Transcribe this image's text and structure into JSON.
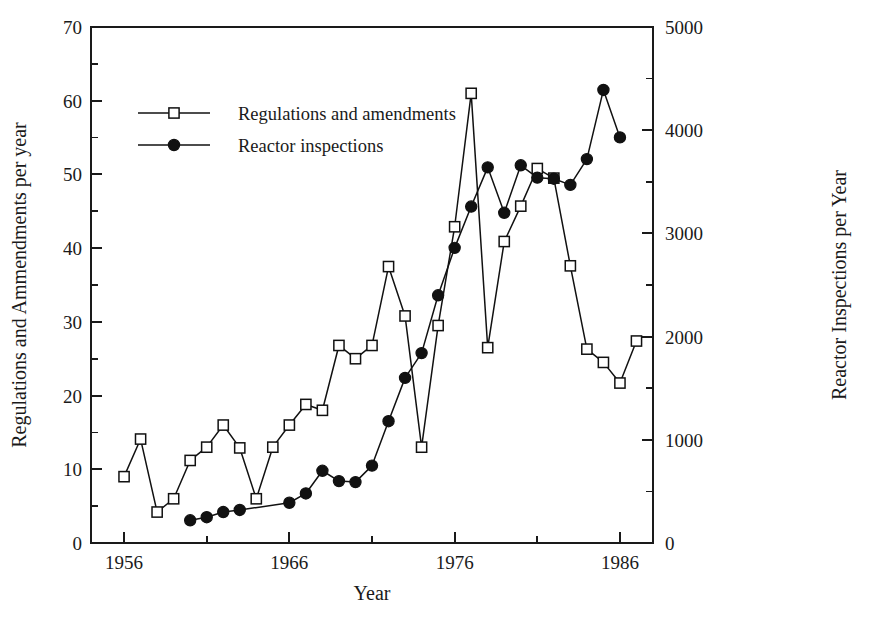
{
  "chart_data": {
    "type": "line",
    "title": "",
    "xlabel": "Year",
    "ylabel": "Regulations and Ammendments per year",
    "y2label": "Reactor Inspections per Year",
    "xlim": [
      1954,
      1988
    ],
    "ylim": [
      0,
      70
    ],
    "y2lim": [
      0,
      5000
    ],
    "grid": false,
    "legend_position": "upper-left-inside",
    "x_ticks_major": [
      "1956",
      "1966",
      "1976",
      "1986"
    ],
    "x_tick_major_values": [
      1956,
      1966,
      1976,
      1986
    ],
    "x_tick_minor_values": [
      1961,
      1971,
      1981,
      1986
    ],
    "y_ticks_major": [
      "0",
      "10",
      "20",
      "30",
      "40",
      "50",
      "60",
      "70"
    ],
    "y_tick_major_values": [
      0,
      10,
      20,
      30,
      40,
      50,
      60,
      70
    ],
    "y_tick_minor_values": [
      5,
      15,
      25,
      35,
      45,
      55,
      65
    ],
    "y2_ticks_major": [
      "0",
      "1000",
      "2000",
      "3000",
      "4000",
      "5000"
    ],
    "y2_tick_major_values": [
      0,
      1000,
      2000,
      3000,
      4000,
      5000
    ],
    "y2_tick_minor_values": [
      500,
      1500,
      2500,
      3500,
      4500
    ],
    "series": [
      {
        "name": "Regulations and amendments",
        "marker": "open-square",
        "axis": "left",
        "x": [
          1956,
          1957,
          1958,
          1959,
          1960,
          1961,
          1962,
          1963,
          1964,
          1965,
          1966,
          1967,
          1968,
          1969,
          1970,
          1971,
          1972,
          1973,
          1974,
          1975,
          1976,
          1977,
          1978,
          1979,
          1980,
          1981,
          1982,
          1983,
          1984,
          1985,
          1986,
          1987
        ],
        "values": [
          9.0,
          14.1,
          4.2,
          6.0,
          11.2,
          13.0,
          16.0,
          12.9,
          6.0,
          13.0,
          16.0,
          18.8,
          18.0,
          26.8,
          25.0,
          26.8,
          37.5,
          30.8,
          13.0,
          29.5,
          42.9,
          61.0,
          26.5,
          40.9,
          45.7,
          50.8,
          49.5,
          37.6,
          26.3,
          24.5,
          21.7,
          27.4
        ]
      },
      {
        "name": "Reactor inspections",
        "marker": "filled-circle",
        "axis": "right",
        "x": [
          1960,
          1961,
          1962,
          1963,
          1966,
          1967,
          1968,
          1969,
          1970,
          1971,
          1972,
          1973,
          1974,
          1975,
          1976,
          1977,
          1978,
          1979,
          1980,
          1981,
          1982,
          1983,
          1984,
          1985,
          1986
        ],
        "values": [
          220,
          250,
          300,
          320,
          390,
          480,
          700,
          600,
          590,
          750,
          1180,
          1600,
          1840,
          2400,
          2860,
          3260,
          3640,
          3200,
          3660,
          3540,
          3530,
          3470,
          3720,
          4390,
          3930
        ]
      }
    ]
  },
  "legend": {
    "items": [
      {
        "label": "Regulations and amendments",
        "marker": "open-square"
      },
      {
        "label": "Reactor inspections",
        "marker": "filled-circle"
      }
    ]
  },
  "colors": {
    "ink": "#1a1a1a",
    "line": "#111111",
    "background": "#ffffff"
  }
}
